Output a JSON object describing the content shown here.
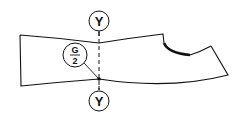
{
  "diagram": {
    "type": "technical-drawing",
    "section_line": {
      "top_label": "Y",
      "bottom_label": "Y",
      "style": "dashed"
    },
    "callout": {
      "numerator": "G",
      "denominator": "2"
    },
    "colors": {
      "stroke": "#111111",
      "background": "#ffffff"
    }
  }
}
